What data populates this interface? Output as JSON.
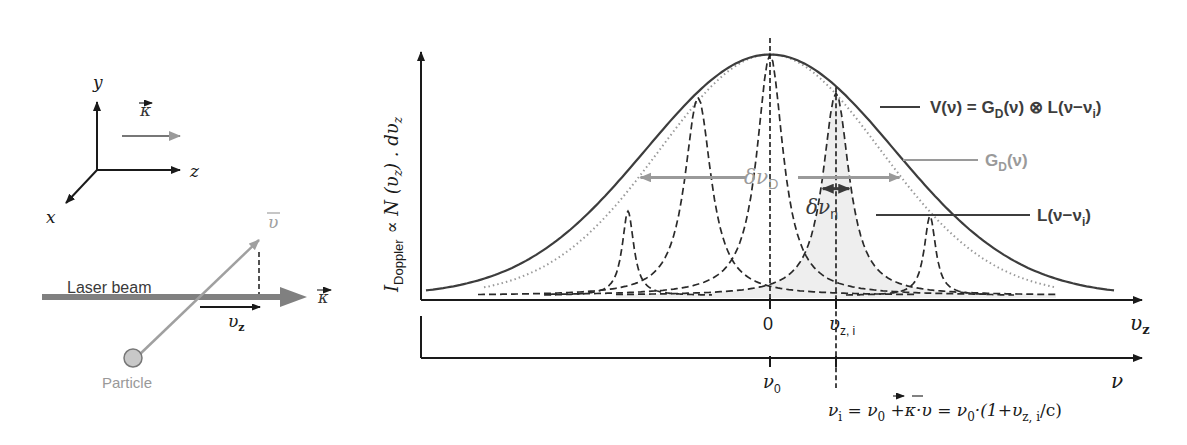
{
  "colors": {
    "axis": "#1a1a1a",
    "voigt": "#3d3d3d",
    "gauss": "#9a9a9a",
    "lorentz": "#2a2a2a",
    "fill": "#eeeeee",
    "laser": "#808080",
    "velocity": "#a0a0a0",
    "particle_fill": "#c8c8c8",
    "particle_label": "#999999"
  },
  "left_panel": {
    "axes": {
      "y": "y",
      "z": "z",
      "x": "x"
    },
    "kappa_label": "κ",
    "velocity_label": "υ",
    "laser_label": "Laser beam",
    "beam_kappa_label": "κ",
    "vz_label": "υ",
    "vz_sub": "z",
    "particle_label": "Particle"
  },
  "chart_data": {
    "type": "line",
    "title": "",
    "ylabel": {
      "I": "I",
      "I_sub": "Doppler",
      "rest": " ∝ N (υ",
      "rest_sub": "z",
      "rest2": ") . dυ",
      "rest2_sub": "z"
    },
    "x_axis_velocity": {
      "label": "υ",
      "label_sub": "z",
      "ticks": [
        {
          "value": 0,
          "label": "0",
          "sub": ""
        },
        {
          "value": 0.33,
          "label": "υ",
          "sub": "z, i"
        }
      ]
    },
    "x_axis_frequency": {
      "label": "ν",
      "ticks": [
        {
          "value": 0,
          "label": "ν",
          "sub": "0"
        },
        {
          "value": 0.33,
          "label": "",
          "sub": ""
        }
      ]
    },
    "xlim": [
      -1.72,
      1.72
    ],
    "ylim": [
      0,
      1
    ],
    "series": [
      {
        "name": "V(ν) = G_D(ν) ⊗ L(ν−ν_i)",
        "kind": "voigt",
        "sigma": 0.62,
        "amplitude": 1.0,
        "style": "solid"
      },
      {
        "name": "G_D(ν)",
        "kind": "gauss",
        "sigma": 0.55,
        "amplitude": 1.0,
        "style": "dotted"
      }
    ],
    "lorentzians": [
      {
        "center": -0.71,
        "amplitude": 0.35,
        "gamma": 0.035
      },
      {
        "center": -0.36,
        "amplitude": 0.822,
        "gamma": 0.08
      },
      {
        "center": 0.0,
        "amplitude": 1.0,
        "gamma": 0.08
      },
      {
        "center": 0.33,
        "amplitude": 0.84,
        "gamma": 0.08,
        "highlighted": true
      },
      {
        "center": 0.8,
        "amplitude": 0.33,
        "gamma": 0.035
      }
    ],
    "annotations": {
      "voigt_label": {
        "V": "V(ν) = G",
        "D": "D",
        "rest": "(ν) ⊗ L(ν−ν",
        "i": "i",
        "end": ")"
      },
      "gauss_label": {
        "G": "G",
        "D": "D",
        "rest": "(ν)"
      },
      "lorentz_label": {
        "L": "L(ν−ν",
        "i": "i",
        "end": ")"
      },
      "doppler_width": {
        "delta": "δν",
        "sub": "D"
      },
      "natural_width": {
        "delta": "δν",
        "sub": "n"
      },
      "formula": {
        "p1": "ν",
        "p1_sub": "i",
        "p2": " = ν",
        "p2_sub": "0",
        "p3": " +κ·υ = ν",
        "p3_sub": "0",
        "p4": "·(1+υ",
        "p4_sub": "z, i",
        "p5": "/c)"
      }
    }
  }
}
